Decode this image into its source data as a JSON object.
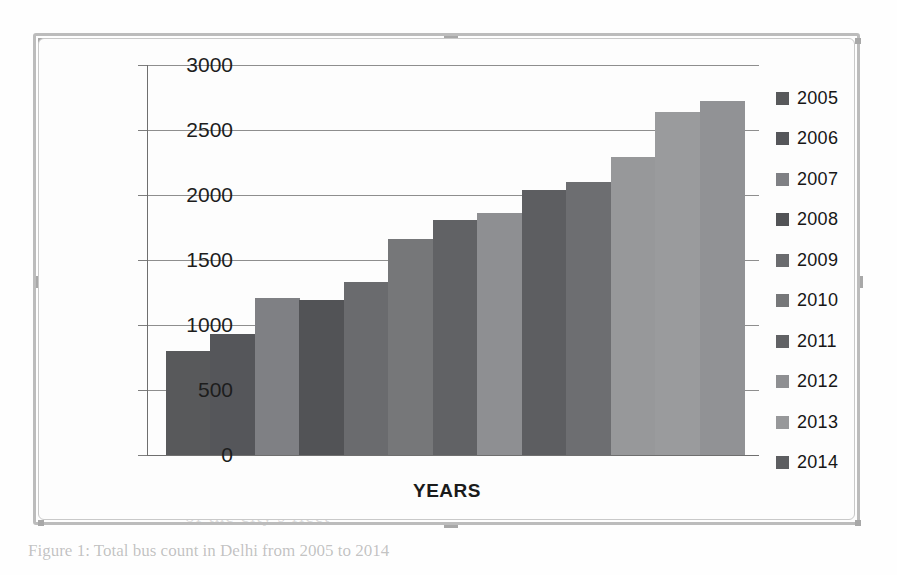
{
  "figure": {
    "caption": "Figure 1: Total bus count in Delhi from 2005 to 2014",
    "x_axis_title": "YEARS"
  },
  "ghost_text": {
    "line1": "the the growth of",
    "line2": "the buses in Delhi",
    "line3": "from the year 2005",
    "line4": "in the number of",
    "line5": "public transport",
    "line6": "buses the total number",
    "line7": "of the city's fleet",
    "line8": "million"
  },
  "chart_data": {
    "type": "bar",
    "title": "",
    "xlabel": "YEARS",
    "ylabel": "",
    "ylim": [
      0,
      3000
    ],
    "ytick_step": 500,
    "ytick_labels": [
      "3000",
      "2500",
      "2000",
      "1500",
      "1000",
      "500",
      "0"
    ],
    "ytick_values": [
      3000,
      2500,
      2000,
      1500,
      1000,
      500,
      0
    ],
    "grid": true,
    "legend_position": "right",
    "categories": [
      "2005",
      "2006",
      "2007",
      "2008",
      "2009",
      "2010",
      "2011",
      "2012",
      "2013",
      "2014"
    ],
    "bars": [
      {
        "label": "2005",
        "value": 800,
        "color": "#58595b"
      },
      {
        "label": "2006",
        "value": 930,
        "color": "#55565a"
      },
      {
        "label": "2007",
        "value": 1210,
        "color": "#7f8084"
      },
      {
        "label": "2008",
        "value": 1190,
        "color": "#525356"
      },
      {
        "label": "2009",
        "value": 1330,
        "color": "#6a6b6e"
      },
      {
        "label": "2010",
        "value": 1660,
        "color": "#767779"
      },
      {
        "label": "2011",
        "value": 1810,
        "color": "#616265"
      },
      {
        "label": "2012",
        "value": 1860,
        "color": "#8e8f92"
      },
      {
        "label": "2013",
        "value": 2040,
        "color": "#5d5e61"
      },
      {
        "label": "2014",
        "value": 2100,
        "color": "#6d6e71"
      },
      {
        "label": "2015",
        "value": 2290,
        "color": "#97989a"
      },
      {
        "label": "2016",
        "value": 2640,
        "color": "#9a9b9d"
      },
      {
        "label": "2017",
        "value": 2720,
        "color": "#919295"
      }
    ],
    "legend": [
      {
        "label": "2005",
        "color": "#58595b"
      },
      {
        "label": "2006",
        "color": "#55565a"
      },
      {
        "label": "2007",
        "color": "#7f8084"
      },
      {
        "label": "2008",
        "color": "#525356"
      },
      {
        "label": "2009",
        "color": "#6a6b6e"
      },
      {
        "label": "2010",
        "color": "#767779"
      },
      {
        "label": "2011",
        "color": "#616265"
      },
      {
        "label": "2012",
        "color": "#8e8f92"
      },
      {
        "label": "2013",
        "color": "#97989a"
      },
      {
        "label": "2014",
        "color": "#5d5e61"
      }
    ]
  }
}
